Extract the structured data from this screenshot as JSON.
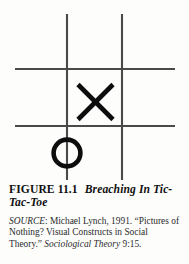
{
  "figure": {
    "kind": "tic-tac-toe-grid",
    "colors": {
      "background": "#fdfdfc",
      "grid_line": "#4a4a4a",
      "mark": "#0d0d0d"
    },
    "grid": {
      "vertical_lines": [
        {
          "name": "vertical-line-left",
          "x": 67,
          "y1": 14,
          "y2": 180
        },
        {
          "name": "vertical-line-right",
          "x": 122,
          "y1": 14,
          "y2": 180
        }
      ],
      "horizontal_lines": [
        {
          "name": "horizontal-line-top",
          "y": 69,
          "x1": 15,
          "x2": 175
        },
        {
          "name": "horizontal-line-bottom",
          "y": 126,
          "x1": 15,
          "x2": 175
        }
      ],
      "line_width": 2.1
    },
    "marks": [
      {
        "name": "mark-x",
        "glyph": "X",
        "cell": "center",
        "cx": 95.5,
        "cy": 102,
        "half": 17.5,
        "stroke": 4.6,
        "breaching": false
      },
      {
        "name": "mark-o",
        "glyph": "O",
        "cell": "on-left-vertical-line",
        "cx": 67,
        "cy": 153,
        "r": 13.4,
        "stroke": 4.6,
        "breaching": true
      }
    ]
  },
  "caption": {
    "label": "FIGURE 11.1",
    "title": "Breaching In Tic-Tac-Toe"
  },
  "source": {
    "lead": "SOURCE",
    "colon": ": ",
    "text_before_journal": "Michael Lynch, 1991. “Pictures of Nothing? Visual Constructs in Social Theory.” ",
    "journal": "Sociological Theory",
    "text_after_journal": " 9:15."
  }
}
